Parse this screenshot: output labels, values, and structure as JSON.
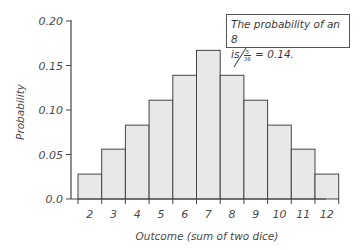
{
  "chart_data": {
    "type": "bar",
    "title": "",
    "xlabel": "Outcome (sum of two dice)",
    "ylabel": "Probability",
    "categories": [
      "2",
      "3",
      "4",
      "5",
      "6",
      "7",
      "8",
      "9",
      "10",
      "11",
      "12"
    ],
    "values": [
      0.028,
      0.056,
      0.083,
      0.111,
      0.139,
      0.167,
      0.139,
      0.111,
      0.083,
      0.056,
      0.028
    ],
    "ylim": [
      0,
      0.2
    ],
    "yticks": [
      "0.0",
      "0.05",
      "0.10",
      "0.15",
      "0.20"
    ],
    "grid": false,
    "legend": null,
    "bar_color": "#e8e8e8",
    "bar_edge_color": "#444444",
    "annotation": {
      "line1": "The probability of an 8",
      "prefix": "is",
      "frac_num": "5",
      "frac_den": "36",
      "suffix": "= 0.14.",
      "points_to": "8"
    }
  }
}
